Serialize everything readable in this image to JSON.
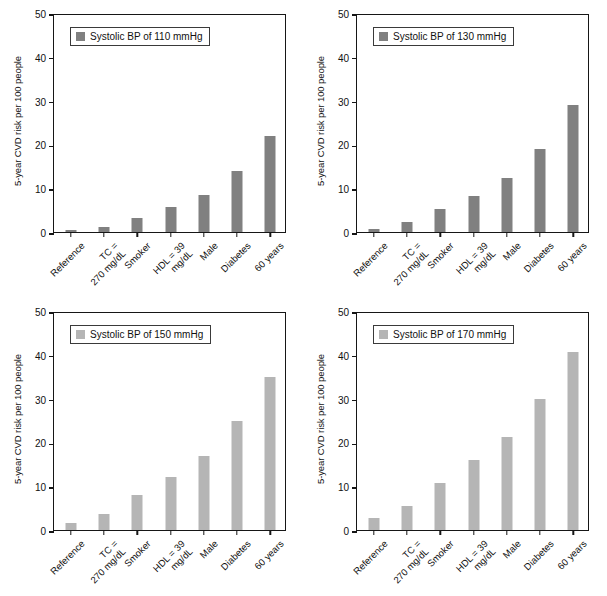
{
  "chart_data": {
    "type": "bar",
    "title": "",
    "xlabel": "",
    "ylabel": "5-year CVD risk per 100 people",
    "ylim": [
      0,
      50
    ],
    "yticks": [
      0,
      10,
      20,
      30,
      40,
      50
    ],
    "grid": false,
    "legend_position": "top-left inside plot",
    "categories": [
      "Reference",
      "TC = 270 mg/dL",
      "Smoker",
      "HDL = 39 mg/dL",
      "Male",
      "Diabetes",
      "60 years"
    ],
    "category_lines": [
      [
        "Reference"
      ],
      [
        "TC =",
        "270 mg/dL"
      ],
      [
        "Smoker"
      ],
      [
        "HDL = 39",
        "mg/dL"
      ],
      [
        "Male"
      ],
      [
        "Diabetes"
      ],
      [
        "60 years"
      ]
    ],
    "panels": [
      {
        "id": "panel-110",
        "legend": "Systolic BP of 110 mmHg",
        "color": "#808080",
        "values": [
          0.4,
          1.2,
          3.2,
          5.6,
          8.4,
          14.0,
          22.0
        ]
      },
      {
        "id": "panel-130",
        "legend": "Systolic BP of 130 mmHg",
        "color": "#808080",
        "values": [
          0.8,
          2.2,
          5.3,
          8.3,
          12.3,
          19.0,
          28.9
        ]
      },
      {
        "id": "panel-150",
        "legend": "Systolic BP of 150 mmHg",
        "color": "#b5b5b5",
        "values": [
          1.6,
          3.6,
          8.0,
          12.1,
          16.8,
          24.9,
          35.0
        ]
      },
      {
        "id": "panel-170",
        "legend": "Systolic BP of 170 mmHg",
        "color": "#b5b5b5",
        "values": [
          2.7,
          5.4,
          10.8,
          16.0,
          21.3,
          30.0,
          40.7
        ]
      }
    ]
  }
}
